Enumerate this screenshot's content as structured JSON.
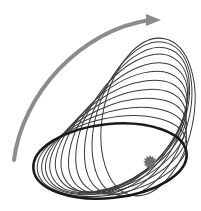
{
  "diagram": {
    "title": "Apsidal precession of an orbit",
    "colors": {
      "background": "#ffffff",
      "orbit": "#3a3a3a",
      "primary_orbit": "#1a1a1a",
      "arrow": "#8c8c8c",
      "star": "#6e6e6e"
    },
    "star": {
      "cx": 150,
      "cy": 162,
      "r": 6,
      "icon": "star-icon"
    },
    "precession_arrow": {
      "path": "M14,160 C22,95 80,30 150,20",
      "head": "150,20",
      "direction": "counter-clockwise",
      "icon": "curved-arrow-icon"
    },
    "primary_orbit": {
      "cx": 110,
      "cy": 161,
      "rx": 77,
      "ry": 37,
      "angle": -6
    },
    "orbits": [
      {
        "cx": 112,
        "cy": 156,
        "rx": 76,
        "ry": 38,
        "angle": -12
      },
      {
        "cx": 114,
        "cy": 151,
        "rx": 75,
        "ry": 39,
        "angle": -18
      },
      {
        "cx": 116,
        "cy": 146,
        "rx": 75,
        "ry": 40,
        "angle": -24
      },
      {
        "cx": 118,
        "cy": 141,
        "rx": 75,
        "ry": 41,
        "angle": -30
      },
      {
        "cx": 121,
        "cy": 136,
        "rx": 75,
        "ry": 42,
        "angle": -36
      },
      {
        "cx": 124,
        "cy": 132,
        "rx": 76,
        "ry": 43,
        "angle": -43
      },
      {
        "cx": 128,
        "cy": 128,
        "rx": 77,
        "ry": 43,
        "angle": -50
      },
      {
        "cx": 132,
        "cy": 124,
        "rx": 78,
        "ry": 44,
        "angle": -57
      },
      {
        "cx": 137,
        "cy": 121,
        "rx": 79,
        "ry": 44,
        "angle": -64
      },
      {
        "cx": 142,
        "cy": 119,
        "rx": 80,
        "ry": 45,
        "angle": -71
      },
      {
        "cx": 148,
        "cy": 117,
        "rx": 80,
        "ry": 45,
        "angle": -78
      }
    ]
  }
}
